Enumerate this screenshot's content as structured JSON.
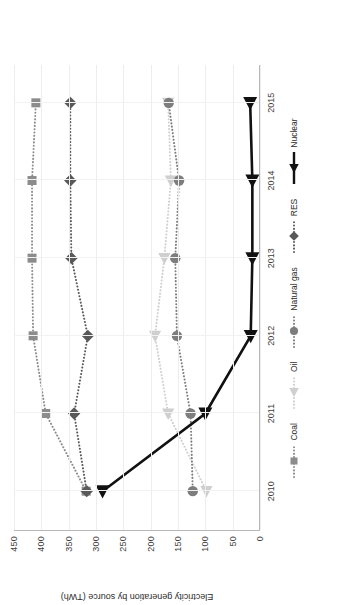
{
  "chart_data": {
    "type": "line",
    "title": "",
    "xlabel": "",
    "ylabel": "Electricity generation by source (TWh)",
    "x": [
      2010,
      2011,
      2012,
      2013,
      2014,
      2015
    ],
    "xtick_labels": [
      "2010",
      "2011",
      "2012",
      "2013",
      "2014",
      "2015"
    ],
    "ylim": [
      0,
      450
    ],
    "ytick_labels": [
      "0",
      "50",
      "100",
      "150",
      "200",
      "250",
      "300",
      "350",
      "400",
      "450"
    ],
    "yticks": [
      0,
      50,
      100,
      150,
      200,
      250,
      300,
      350,
      400,
      450
    ],
    "grid": "horizontal-and-vertical",
    "legend_position": "bottom",
    "series": [
      {
        "name": "Coal",
        "values": [
          318,
          392,
          415,
          417,
          417,
          410
        ],
        "marker": "square",
        "color": "#8c8c8c",
        "linestyle": "dotted"
      },
      {
        "name": "Oil",
        "values": [
          98,
          168,
          192,
          175,
          163,
          168
        ],
        "marker": "triangle-left",
        "color": "#cfcfcf",
        "linestyle": "dotted"
      },
      {
        "name": "Natural gas",
        "values": [
          123,
          127,
          152,
          155,
          148,
          167
        ],
        "marker": "circle",
        "color": "#7d7d7d",
        "linestyle": "dotted"
      },
      {
        "name": "RES",
        "values": [
          317,
          340,
          315,
          345,
          347,
          347
        ],
        "marker": "diamond",
        "color": "#595959",
        "linestyle": "dotted"
      },
      {
        "name": "Nuclear",
        "values": [
          288,
          100,
          17,
          14,
          14,
          18
        ],
        "marker": "triangle-left",
        "color": "#111111",
        "linestyle": "solid"
      }
    ]
  },
  "legend": {
    "items": [
      {
        "label": "Coal"
      },
      {
        "label": "Oil"
      },
      {
        "label": "Natural gas"
      },
      {
        "label": "RES"
      },
      {
        "label": "Nuclear"
      }
    ]
  }
}
